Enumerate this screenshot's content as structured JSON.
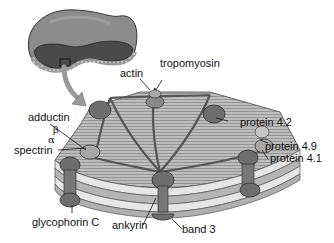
{
  "diagram": {
    "type": "red blood cell membrane cytoskeleton",
    "labels": {
      "actin": "actin",
      "tropomyosin": "tropomyosin",
      "protein_4_2": "protein 4.2",
      "adductin": "adductin",
      "beta": "β",
      "alpha": "α",
      "spectrin": "spectrin",
      "protein_4_9": "protein 4.9",
      "protein_4_1": "protein 4.1",
      "glycophorin_c": "glycophorin C",
      "ankyrin": "ankyrin",
      "band_3": "band 3"
    },
    "colors": {
      "cell_outer": "#8a8a8a",
      "cell_inner": "#4a4a4a",
      "membrane_face": "#b9b9b9",
      "membrane_stripe": "#7d7d7d",
      "bilayer_light": "#e6e6e6",
      "protein": "#6e6e6e",
      "protein_light": "#a8a8a8",
      "arrow": "#9a9a9a",
      "text": "#111111"
    }
  }
}
